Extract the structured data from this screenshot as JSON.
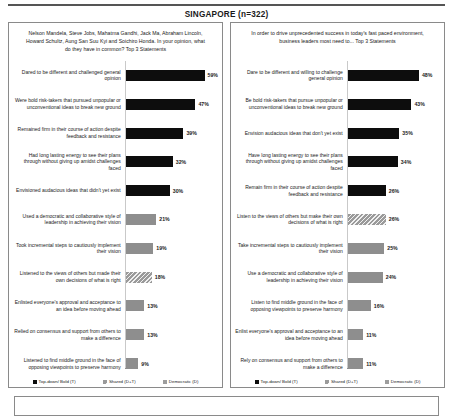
{
  "title": "SINGAPORE (n=322)",
  "legend": {
    "items": [
      {
        "label": "Top-down/ Bold (T)",
        "style": "t",
        "color": "#0d0d0d"
      },
      {
        "label": "Shared (D+T)",
        "style": "dt",
        "color": "#9a9a9a"
      },
      {
        "label": "Democratic (D)",
        "style": "d",
        "color": "#9d9d9d"
      }
    ]
  },
  "panels": [
    {
      "name": "left",
      "question": "Nelson Mandela, Steve Jobs, Mahatma Gandhi, Jack Ma, Abraham Lincoln, Howard Schultz, Aung San Suu Kyi and Soichiro Honda. In your opinion, what do they have in common? Top 3 Statements",
      "chart_data": {
        "type": "bar",
        "title": "Nelson Mandela, Steve Jobs, Mahatma Gandhi, Jack Ma, Abraham Lincoln, Howard Schultz, Aung San Suu Kyi and Soichiro Honda. In your opinion, what do they have in common? Top 3 Statements",
        "xlabel": "",
        "ylabel": "",
        "xlim": [
          0,
          60
        ],
        "grid": false,
        "legend_position": "bottom",
        "orientation": "horizontal",
        "categories": [
          "Dared to be different and challenged general opinion",
          "Were bold risk-takers that pursued unpopular or unconventional ideas to break new ground",
          "Remained firm in their course of action despite feedback and resistance",
          "Had long lasting energy to see their plans through without giving up amidst challenges faced",
          "Envisioned audacious  ideas that didn't yet exist",
          "Used a democratic and collaborative style of leadership  in achieving their vision",
          "Took incremental steps to cautiously implement their vision",
          "Listened to the views of others but made their own decisions of what is right",
          "Enlisted everyone's approval and acceptance to an idea before moving ahead",
          "Relied on consensus and support from others to make a difference",
          "Listened to find middle ground in the face of opposing viewpoints  to preserve harmony"
        ],
        "values": [
          59,
          47,
          39,
          32,
          30,
          21,
          19,
          18,
          13,
          13,
          9
        ],
        "value_labels": [
          "59%",
          "47%",
          "39%",
          "32%",
          "30%",
          "21%",
          "19%",
          "18%",
          "13%",
          "13%",
          "9%"
        ],
        "series_styles": [
          "t",
          "t",
          "t",
          "t",
          "t",
          "d",
          "d",
          "dt",
          "d",
          "d",
          "d"
        ]
      }
    },
    {
      "name": "right",
      "question": "In order to drive unprecedented success in today's fast paced environment, business leaders most need to... Top 3 Statements",
      "chart_data": {
        "type": "bar",
        "title": "In order to drive unprecedented success in today's fast paced environment, business leaders most need to... Top 3 Statements",
        "xlabel": "",
        "ylabel": "",
        "xlim": [
          0,
          60
        ],
        "grid": false,
        "legend_position": "bottom",
        "orientation": "horizontal",
        "categories": [
          "Dare to be different and willing to challenge  general opinion",
          "Be bold risk-takers  that pursue unpopular or unconventional ideas to break new ground",
          "Envision audacious ideas that don't yet exist",
          "Have long lasting energy to see their plans through without giving up amidst challenges faced",
          "Remain firm in their course of action despite feedback and resistance",
          "Listen to the views of others but make their own decisions of what is right",
          "Take incremental steps to cautiously implement their vision",
          "Use a democratic and collaborative style of leadership  in achieving their vision",
          "Listen to find middle ground in the face of opposing viewpoints  to preserve harmony",
          "Enlist everyone's approval and acceptance to an idea before moving ahead",
          "Rely on consensus and support from others to make a difference"
        ],
        "values": [
          48,
          43,
          35,
          34,
          26,
          26,
          25,
          24,
          16,
          11,
          11
        ],
        "value_labels": [
          "48%",
          "43%",
          "35%",
          "34%",
          "26%",
          "26%",
          "25%",
          "24%",
          "16%",
          "11%",
          "11%"
        ],
        "series_styles": [
          "t",
          "t",
          "t",
          "t",
          "t",
          "dt",
          "d",
          "d",
          "d",
          "d",
          "d"
        ]
      }
    }
  ]
}
